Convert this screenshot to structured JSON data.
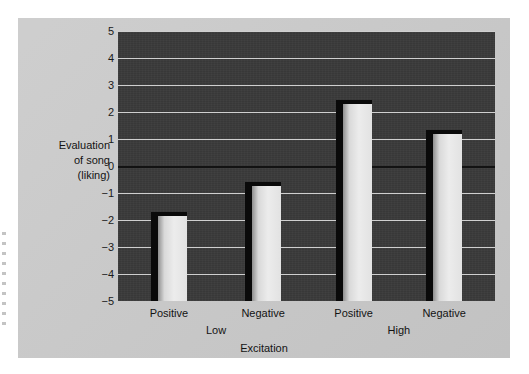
{
  "chart_data": {
    "type": "bar",
    "title": "",
    "subtitle": "",
    "xlabel": "Excitation",
    "ylabel": "Evaluation of song (liking)",
    "ylabel_lines": [
      "Evaluation",
      "of song",
      "(liking)"
    ],
    "ylim": [
      -5,
      5
    ],
    "ytick_labels": [
      "5",
      "4",
      "3",
      "2",
      "1",
      "0",
      "−1",
      "−2",
      "−3",
      "−4",
      "−5"
    ],
    "ytick_values": [
      5,
      4,
      3,
      2,
      1,
      0,
      -1,
      -2,
      -3,
      -4,
      -5
    ],
    "grid": true,
    "legend": "none",
    "categories": [
      "Positive",
      "Negative",
      "Positive",
      "Negative"
    ],
    "groups": [
      {
        "label": "Low",
        "categories": [
          "Positive",
          "Negative"
        ]
      },
      {
        "label": "High",
        "categories": [
          "Positive",
          "Negative"
        ]
      }
    ],
    "values": [
      -1.7,
      -0.6,
      2.45,
      1.35
    ],
    "bars": [
      {
        "group": "Low",
        "category": "Positive",
        "value": -1.7
      },
      {
        "group": "Low",
        "category": "Negative",
        "value": -0.6
      },
      {
        "group": "High",
        "category": "Positive",
        "value": 2.45
      },
      {
        "group": "High",
        "category": "Negative",
        "value": 1.35
      }
    ],
    "colors": {
      "plot_background": "#3a3a3a",
      "page_background": "#c9c9c9",
      "gridline": "#cfcfcf",
      "zero_line": "#121212",
      "bar_fill": "#ececec",
      "bar_shadow": "#0a0a0a"
    }
  },
  "axes": {
    "y_title_line1": "Evaluation",
    "y_title_line2": "of song",
    "y_title_line3": "(liking)",
    "x_title": "Excitation"
  },
  "ticks": {
    "y": [
      "5",
      "4",
      "3",
      "2",
      "1",
      "0",
      "−1",
      "−2",
      "−3",
      "−4",
      "−5"
    ],
    "x": [
      "Positive",
      "Negative",
      "Positive",
      "Negative"
    ],
    "groups": [
      "Low",
      "High"
    ]
  }
}
